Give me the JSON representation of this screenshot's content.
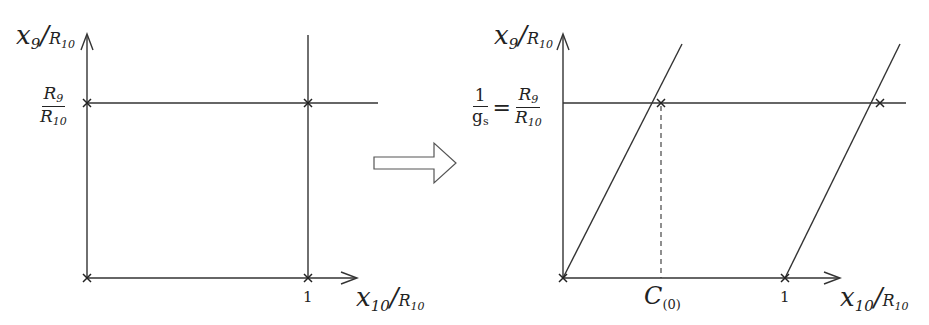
{
  "colors": {
    "line": "#333333",
    "arrow_outline": "#555555",
    "background": "#ffffff"
  },
  "left_panel": {
    "y_axis_label": {
      "var": "x",
      "sub": "9",
      "den_var": "R",
      "den_sub": "10"
    },
    "x_axis_label": {
      "var": "x",
      "sub": "10",
      "den_var": "R",
      "den_sub": "10"
    },
    "y_tick": {
      "num_var": "R",
      "num_sub": "9",
      "den_var": "R",
      "den_sub": "10"
    },
    "x_tick": "1"
  },
  "transition_arrow": {
    "icon": "hollow-right-arrow"
  },
  "right_panel": {
    "y_axis_label": {
      "var": "x",
      "sub": "9",
      "den_var": "R",
      "den_sub": "10"
    },
    "x_axis_label": {
      "var": "x",
      "sub": "10",
      "den_var": "R",
      "den_sub": "10"
    },
    "y_tick": {
      "lhs_num": "1",
      "lhs_den_var": "g",
      "lhs_den_sub": "s",
      "equals": "=",
      "num_var": "R",
      "num_sub": "9",
      "den_var": "R",
      "den_sub": "10"
    },
    "x_ticks": {
      "c_var": "C",
      "c_sub": "(0)",
      "one": "1"
    }
  }
}
